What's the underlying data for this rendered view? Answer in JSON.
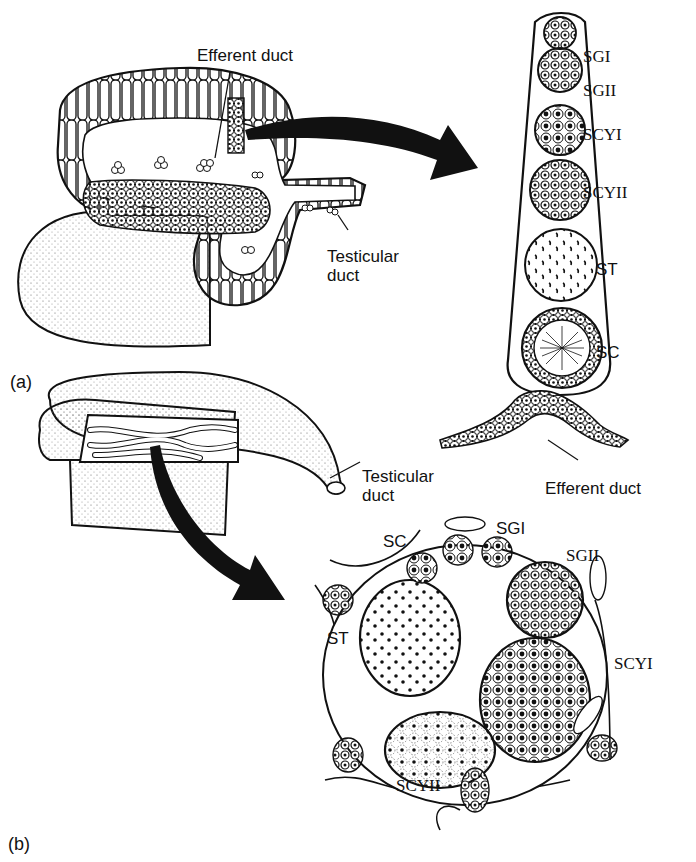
{
  "figure": {
    "panels": [
      {
        "id": "a",
        "label": "(a)",
        "labels": {
          "efferent_duct_top": "Efferent duct",
          "testicular_duct": "Testicular\nduct",
          "testicular_duct_line1": "Testicular",
          "testicular_duct_line2": "duct",
          "efferent_duct_bottom": "Efferent duct"
        },
        "lobule_stages": [
          {
            "abbr": "SGI",
            "name": "spermatogonia I"
          },
          {
            "abbr": "SGII",
            "name": "spermatogonia II"
          },
          {
            "abbr": "SCYI",
            "name": "primary spermatocytes"
          },
          {
            "abbr": "SCYII",
            "name": "secondary spermatocytes"
          },
          {
            "abbr": "ST",
            "name": "spermatids"
          },
          {
            "abbr": "SC",
            "name": "spermatozoa"
          }
        ]
      },
      {
        "id": "b",
        "label": "(b)",
        "labels": {
          "testicular_duct_line1": "Testicular",
          "testicular_duct_line2": "duct"
        },
        "cyst_labels": [
          "SC",
          "SGI",
          "SGII",
          "ST",
          "SCYI",
          "SCYII"
        ]
      }
    ],
    "colors": {
      "ink": "#111111",
      "background": "#ffffff",
      "stipple": "#555555"
    }
  }
}
